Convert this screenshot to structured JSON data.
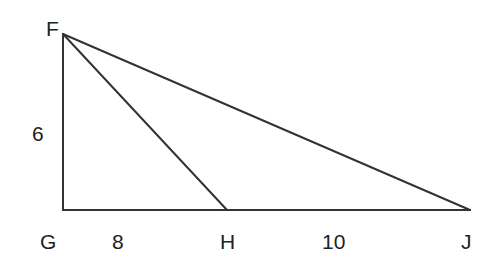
{
  "diagram": {
    "type": "geometry-triangle",
    "points": {
      "F": {
        "label": "F",
        "x": 63,
        "y": 34
      },
      "G": {
        "label": "G",
        "x": 63,
        "y": 210
      },
      "H": {
        "label": "H",
        "x": 227,
        "y": 210
      },
      "J": {
        "label": "J",
        "x": 470,
        "y": 210
      }
    },
    "segments": [
      {
        "from": "F",
        "to": "G"
      },
      {
        "from": "G",
        "to": "J"
      },
      {
        "from": "F",
        "to": "J"
      },
      {
        "from": "F",
        "to": "H"
      }
    ],
    "measures": {
      "FG": "6",
      "GH": "8",
      "HJ": "10"
    },
    "stroke_color": "#333333",
    "label_color": "#222222"
  }
}
